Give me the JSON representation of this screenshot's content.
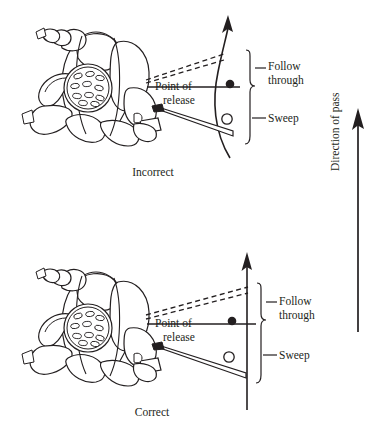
{
  "figure": {
    "width": 382,
    "height": 434,
    "ink_color": "#231f20",
    "background_color": "#ffffff"
  },
  "panels": [
    {
      "id": "top",
      "caption": "Incorrect",
      "release_label_line1": "Point of",
      "release_label_line2": "release",
      "zone_upper": "Follow",
      "zone_upper_line2": "through",
      "zone_lower": "Sweep",
      "delivery_path": "curved",
      "ball_released": "filled-dot",
      "ball_start": "open-circle"
    },
    {
      "id": "bottom",
      "caption": "Correct",
      "release_label_line1": "Point of",
      "release_label_line2": "release",
      "zone_upper": "Follow",
      "zone_upper_line2": "through",
      "zone_lower": "Sweep",
      "delivery_path": "straight",
      "ball_released": "filled-dot",
      "ball_start": "open-circle"
    }
  ],
  "direction_axis": {
    "label": "Direction of pass",
    "arrow_direction": "up"
  }
}
